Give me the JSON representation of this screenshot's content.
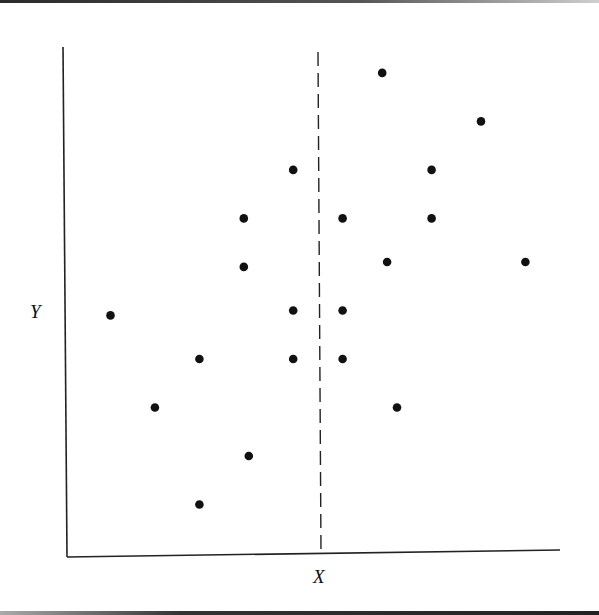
{
  "chart_data": {
    "type": "scatter",
    "title": "",
    "xlabel": "X",
    "ylabel": "Y",
    "grid": false,
    "legend": null,
    "axis_ticks": "none",
    "xlim": [
      0,
      100
    ],
    "ylim": [
      0,
      100
    ],
    "reference_line": {
      "orientation": "vertical",
      "style": "dashed",
      "x": 51,
      "label": ""
    },
    "points": [
      {
        "x": 9,
        "y": 49
      },
      {
        "x": 18,
        "y": 30
      },
      {
        "x": 27,
        "y": 10
      },
      {
        "x": 27,
        "y": 40
      },
      {
        "x": 37,
        "y": 20
      },
      {
        "x": 36,
        "y": 59
      },
      {
        "x": 36,
        "y": 69
      },
      {
        "x": 46,
        "y": 40
      },
      {
        "x": 46,
        "y": 50
      },
      {
        "x": 46,
        "y": 79
      },
      {
        "x": 56,
        "y": 40
      },
      {
        "x": 56,
        "y": 50
      },
      {
        "x": 56,
        "y": 69
      },
      {
        "x": 64,
        "y": 99
      },
      {
        "x": 65,
        "y": 60
      },
      {
        "x": 67,
        "y": 30
      },
      {
        "x": 74,
        "y": 79
      },
      {
        "x": 74,
        "y": 69
      },
      {
        "x": 84,
        "y": 89
      },
      {
        "x": 93,
        "y": 60
      }
    ]
  },
  "labels": {
    "x_axis": "X",
    "y_axis": "Y"
  },
  "colors": {
    "axis": "#222222",
    "points": "#111111",
    "dashed_line": "#222222",
    "background": "#ffffff"
  }
}
